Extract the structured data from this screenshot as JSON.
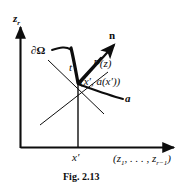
{
  "figure": {
    "caption": "Fig. 2.13",
    "axes": {
      "vertical_label": "z",
      "vertical_label_sub": "r",
      "horizontal_label_prefix": "(z",
      "horizontal_label_sub1": "1",
      "horizontal_label_mid": ", . . . , z",
      "horizontal_label_sub2": "r−1",
      "horizontal_label_suffix": ")",
      "tick_label": "x′"
    },
    "labels": {
      "boundary": "∂Ω",
      "normal_vector": "n",
      "tangent_vector": "t",
      "point_function": "P(z)",
      "point_coordinates": "(x′, a(x′))",
      "graph_function": "a"
    },
    "colors": {
      "ink": "#0d0d0d",
      "background": "#ffffff"
    }
  }
}
